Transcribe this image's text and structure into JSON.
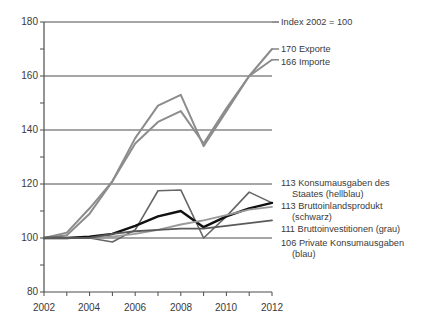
{
  "chart_data": {
    "type": "line",
    "title": "",
    "subtitle": "",
    "note": "Index 2002 = 100",
    "xlabel": "",
    "ylabel": "",
    "xlim": [
      2002,
      2012
    ],
    "ylim": [
      80,
      180
    ],
    "grid": true,
    "grid_values": [
      180,
      160,
      140,
      120,
      100
    ],
    "legend_position": "right-inline",
    "x": [
      2002,
      2003,
      2004,
      2005,
      2006,
      2007,
      2008,
      2009,
      2010,
      2011,
      2012
    ],
    "y_ticks": [
      180,
      160,
      140,
      120,
      100,
      80
    ],
    "y_tick_labels": [
      "180",
      "160",
      "140",
      "120",
      "100",
      "80"
    ],
    "x_ticks": [
      2002,
      2003,
      2004,
      2005,
      2006,
      2007,
      2008,
      2009,
      2010,
      2011,
      2012
    ],
    "x_tick_labels": [
      "2002",
      "",
      "2004",
      "",
      "2006",
      "",
      "2008",
      "",
      "2010",
      "",
      "2012"
    ],
    "x_tick_labels_shown": [
      "2002",
      "2004",
      "2006",
      "2008",
      "2010",
      "2012"
    ],
    "series": [
      {
        "name": "Exporte",
        "end_value": 170,
        "label": "170 Exporte",
        "color": "#8c8c8c",
        "width": 2.0,
        "values": [
          100,
          102,
          111,
          121,
          137,
          149,
          153,
          134,
          147,
          160,
          170
        ]
      },
      {
        "name": "Importe",
        "end_value": 166,
        "label": "166 Importe",
        "color": "#8c8c8c",
        "width": 2.0,
        "values": [
          100,
          101,
          109,
          121,
          135,
          143,
          147,
          135,
          148,
          160,
          166
        ]
      },
      {
        "name": "Konsumausgaben des Staates (hellblau)",
        "end_value": 113,
        "label": "113 Konsumausgaben des",
        "label_line2": "Staates (hellblau)",
        "color": "#666666",
        "width": 1.6,
        "values": [
          100,
          100,
          100,
          98.5,
          103,
          117.5,
          117.8,
          100,
          108,
          117,
          113
        ]
      },
      {
        "name": "Bruttoinlandsprodukt (schwarz)",
        "end_value": 113,
        "label": "113 Bruttoinlandsprodukt",
        "label_line2": "(schwarz)",
        "color": "#111111",
        "width": 2.4,
        "values": [
          100,
          100,
          100.5,
          101.5,
          104.5,
          108,
          110,
          104,
          108,
          111,
          113
        ]
      },
      {
        "name": "Bruttoinvestitionen (grau)",
        "end_value": 111,
        "label": "111 Bruttoinvestitionen (grau)",
        "color": "#9a9a9a",
        "width": 1.8,
        "values": [
          100,
          100,
          100,
          100.5,
          101.5,
          103,
          105,
          106.5,
          108.5,
          110.5,
          111.5
        ]
      },
      {
        "name": "Private Konsumausgaben (blau)",
        "end_value": 106,
        "label": "106 Private Konsumausgaben",
        "label_line2": "(blau)",
        "color": "#5a5a5a",
        "width": 1.8,
        "values": [
          100,
          100,
          100,
          101.5,
          102.5,
          103,
          103.5,
          103.5,
          104.5,
          105.5,
          106.5
        ]
      }
    ]
  },
  "axes": {
    "y_labels": [
      "180",
      "160",
      "140",
      "120",
      "100",
      "80"
    ],
    "x_labels": [
      "2002",
      "2004",
      "2006",
      "2008",
      "2010",
      "2012"
    ]
  },
  "annotations": {
    "index_note": "Index 2002 = 100",
    "exporte": "170 Exporte",
    "importe": "166 Importe",
    "staat_l1": "113 Konsumausgaben des",
    "staat_l2": "Staates (hellblau)",
    "bip_l1": "113 Bruttoinlandsprodukt",
    "bip_l2": "(schwarz)",
    "invest": "111 Bruttoinvestitionen (grau)",
    "privat_l1": "106 Private Konsumausgaben",
    "privat_l2": "(blau)"
  }
}
